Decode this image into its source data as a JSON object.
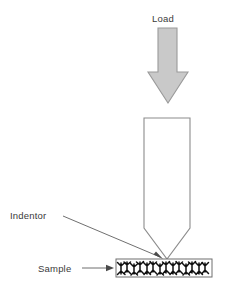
{
  "figure": {
    "background_color": "#ffffff",
    "width": 229,
    "height": 293
  },
  "labels": {
    "load": "Load",
    "indentor": "Indentor",
    "sample": "Sample"
  },
  "colors": {
    "load_arrow_fill": "#c9c9c9",
    "load_arrow_stroke": "#9a9a9a",
    "indentor_fill": "#ffffff",
    "indentor_stroke": "#8c8c8c",
    "sample_frame_stroke": "#6e6e6e",
    "grain_color": "#111111",
    "text_color": "#3a3a3a",
    "leader_color": "#4a4a4a"
  },
  "elements": {
    "load_arrow": {
      "name": "load-arrow",
      "description": "downward filled block arrow representing applied load",
      "direction": "down",
      "shaft_left": 158,
      "shaft_right": 177,
      "shaft_top": 28,
      "head_top": 72,
      "head_left": 148,
      "head_right": 188,
      "tip_x": 168,
      "tip_y": 103
    },
    "indentor": {
      "name": "indentor-body",
      "description": "tall rectangular indenter with conical pointed tip",
      "left": 144,
      "right": 190,
      "top": 118,
      "shoulder_y": 228,
      "tip_x": 167,
      "tip_y": 259
    },
    "sample": {
      "name": "sample-bar",
      "description": "thin horizontal specimen bar filled with dendritic grain microstructure",
      "left": 116,
      "right": 212,
      "top": 259,
      "bottom": 277
    },
    "indentor_leader": {
      "name": "indentor-leader-line",
      "from_x": 63,
      "from_y": 216,
      "to_x": 163,
      "to_y": 259
    },
    "sample_leader": {
      "name": "sample-leader-arrow",
      "from_x": 82,
      "from_y": 268,
      "to_x": 114,
      "to_y": 268
    }
  }
}
